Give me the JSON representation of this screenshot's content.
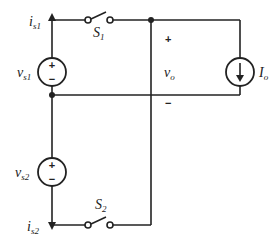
{
  "diagram": {
    "type": "circuit",
    "components": {
      "vs1": {
        "kind": "voltage-source",
        "label": "v",
        "sub": "s1",
        "plus": "+",
        "minus": "−"
      },
      "vs2": {
        "kind": "voltage-source",
        "label": "v",
        "sub": "s2",
        "plus": "+",
        "minus": "−"
      },
      "is1": {
        "kind": "current-arrow",
        "label": "i",
        "sub": "s1"
      },
      "is2": {
        "kind": "current-arrow",
        "label": "i",
        "sub": "s2"
      },
      "S1": {
        "kind": "switch",
        "label": "S",
        "sub": "1"
      },
      "S2": {
        "kind": "switch",
        "label": "S",
        "sub": "2"
      },
      "Io": {
        "kind": "current-source",
        "label": "I",
        "sub": "o"
      },
      "vo": {
        "kind": "voltage-label",
        "label": "v",
        "sub": "o",
        "plus": "+",
        "minus": "−"
      }
    },
    "colors": {
      "line": "#222222",
      "background": "#ffffff"
    }
  }
}
